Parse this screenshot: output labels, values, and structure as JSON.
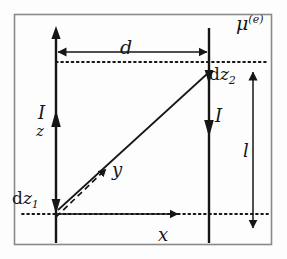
{
  "figure": {
    "background_color": "#fdfdfd",
    "frame_color": "#808080",
    "ink_color": "#161616"
  },
  "labels": {
    "separation": "d",
    "mu_symbol": "μ",
    "mu_superscript": "(e)",
    "current_left": "I",
    "current_right": "I",
    "axis_z": "z",
    "axis_y": "y",
    "axis_x": "x",
    "length": "l",
    "element_1_prefix": "d",
    "element_1_var": "z",
    "element_1_sub": "1",
    "element_2_prefix": "d",
    "element_2_var": "z",
    "element_2_sub": "2"
  },
  "geometry": {
    "frame": {
      "x": 14,
      "y": 14,
      "width": 258,
      "height": 231
    },
    "left_wire_x": 56,
    "right_wire_x": 209,
    "wire_top_y": 28,
    "wire_bottom_y": 243,
    "left_current_direction": "up",
    "right_current_direction": "down",
    "dz2_y": 72,
    "dz1_y": 214,
    "x_axis_y": 214,
    "d_arrow_y": 52,
    "l_arrow_x": 253,
    "l_arrow_top_y": 72,
    "l_arrow_bottom_y": 228,
    "dotted_top_line": {
      "x1": 56,
      "x2": 268,
      "y": 62
    },
    "dotted_bottom_line": {
      "x1": 22,
      "x2": 268,
      "y": 214
    },
    "x_axis_arrow": {
      "x1": 56,
      "x2": 180,
      "y": 214
    },
    "connector_line": {
      "x1": 58,
      "y1": 210,
      "x2": 207,
      "y2": 74
    },
    "y_axis_dashed": {
      "x1": 56,
      "y1": 216,
      "x2": 108,
      "y2": 167
    }
  }
}
